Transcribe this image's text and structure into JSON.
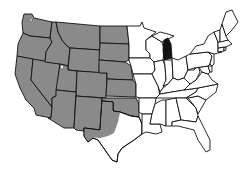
{
  "map": {
    "type": "US states choropleth",
    "colors": {
      "highlight_gray": "#8a8a8a",
      "highlight_black": "#111111",
      "default": "#ffffff",
      "border": "#111111"
    },
    "legend": null,
    "shaded_gray_states": [
      "WA",
      "OR",
      "CA",
      "NV",
      "ID",
      "MT",
      "WY",
      "UT",
      "CO",
      "AZ",
      "NM",
      "ND",
      "SD",
      "NE",
      "KS",
      "OK",
      "TX (west)"
    ],
    "shaded_black_states": [
      "MI (lower peninsula)"
    ],
    "unshaded_states": [
      "MN",
      "IA",
      "MO",
      "AR",
      "LA",
      "WI",
      "IL",
      "IN",
      "OH",
      "KY",
      "TN",
      "MS",
      "AL",
      "GA",
      "FL",
      "SC",
      "NC",
      "VA",
      "WV",
      "MD",
      "DE",
      "PA",
      "NJ",
      "NY",
      "CT",
      "RI",
      "MA",
      "VT",
      "NH",
      "ME",
      "TX (east)",
      "MI (upper peninsula)"
    ]
  }
}
